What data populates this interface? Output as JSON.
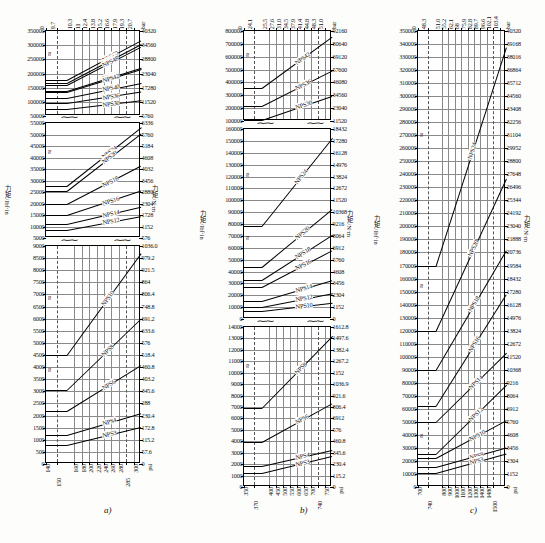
{
  "figure": {
    "axis_title_left": "力矩 /lbf·in",
    "axis_title_right": "力矩 /N·m",
    "unit_top": "bar",
    "unit_bottom": "psi",
    "panels": [
      "a)",
      "b)",
      "c)"
    ]
  },
  "chart_data": [
    {
      "id": "a-top",
      "type": "line",
      "panel": "a)",
      "title": "",
      "xlabel": "bar",
      "ylabel": "力矩 /lbf·in",
      "y2label": "力矩 /N·m",
      "ylim": [
        50000,
        350000
      ],
      "yticks": [
        50000,
        100000,
        150000,
        200000,
        250000,
        300000,
        350000
      ],
      "y2ticks": [
        5760,
        11520,
        17280,
        23040,
        28800,
        34560,
        40320
      ],
      "xticks_top": [
        "0",
        "9.7",
        "10.3",
        "11",
        "12.4",
        "13.8",
        "15.2",
        "16.6",
        "17.9",
        "19.3",
        "20.7"
      ],
      "series": [
        {
          "name": "NPS60",
          "y_start": 178000,
          "y_end": 318000
        },
        {
          "name": "NPS54",
          "y_start": 168000,
          "y_end": 305000
        },
        {
          "name": "NPS48",
          "y_start": 160000,
          "y_end": 295000
        },
        {
          "name": "NPS46",
          "y_start": 140000,
          "y_end": 222000
        },
        {
          "name": "NPS42",
          "y_start": 133000,
          "y_end": 214000
        },
        {
          "name": "NPS40",
          "y_start": 115000,
          "y_end": 168000
        },
        {
          "name": "NPS36",
          "y_start": 95000,
          "y_end": 136000
        },
        {
          "name": "NPS30",
          "y_start": 74000,
          "y_end": 105000
        }
      ]
    },
    {
      "id": "a-mid",
      "type": "line",
      "panel": "a)",
      "ylim": [
        5000,
        55000
      ],
      "yticks": [
        5000,
        10000,
        15000,
        20000,
        25000,
        30000,
        35000,
        40000,
        45000,
        50000,
        55000
      ],
      "y2ticks": [
        576,
        1152,
        1728,
        2304,
        2880,
        3456,
        4032,
        4608,
        5184,
        5760,
        6336
      ],
      "series": [
        {
          "name": "NPS24",
          "y_start": 27500,
          "y_end": 53000
        },
        {
          "name": "NPS20",
          "y_start": 25500,
          "y_end": 50500
        },
        {
          "name": "NPS18",
          "y_start": 19800,
          "y_end": 36500
        },
        {
          "name": "NPS16",
          "y_start": 14800,
          "y_end": 25500
        },
        {
          "name": "NPS14",
          "y_start": 11000,
          "y_end": 18500
        },
        {
          "name": "NPS12",
          "y_start": 8500,
          "y_end": 14500
        }
      ]
    },
    {
      "id": "a-bot",
      "type": "line",
      "panel": "a)",
      "xlabel": "psi",
      "ylim": [
        0,
        9000
      ],
      "yticks": [
        0,
        500,
        1000,
        1500,
        2000,
        2500,
        3000,
        3500,
        4000,
        4500,
        5000,
        5500,
        6000,
        6500,
        7000,
        7500,
        8000,
        8500,
        9000
      ],
      "y2ticks": [
        "0",
        "57.6",
        "115.2",
        "172.8",
        "230.4",
        "288",
        "345.6",
        "403.2",
        "460.8",
        "518.4",
        "576",
        "633.6",
        "691.2",
        "748.8",
        "806.4",
        "864",
        "921.5",
        "979.2",
        "1036.0"
      ],
      "xticks_bottom": [
        "140",
        "150",
        "160",
        "180",
        "200",
        "220",
        "240",
        "260",
        "280",
        "285",
        "300"
      ],
      "series": [
        {
          "name": "NPS10",
          "y_start": 4500,
          "y_end": 8700
        },
        {
          "name": "NPS8",
          "y_start": 3050,
          "y_end": 6000
        },
        {
          "name": "NPS6",
          "y_start": 2200,
          "y_end": 4100
        },
        {
          "name": "NPS4",
          "y_start": 1200,
          "y_end": 2100
        },
        {
          "name": "NPS3",
          "y_start": 800,
          "y_end": 1550
        }
      ]
    },
    {
      "id": "b-top",
      "type": "line",
      "panel": "b)",
      "xlabel": "bar",
      "ylim": [
        100000,
        800000
      ],
      "yticks": [
        100000,
        200000,
        300000,
        400000,
        500000,
        600000,
        700000,
        800000
      ],
      "y2ticks": [
        11520,
        23040,
        34560,
        46080,
        57600,
        69120,
        80640,
        92160
      ],
      "xticks_top": [
        "0",
        "24.1",
        "25.5",
        "27.6",
        "31.0",
        "34.5",
        "37.9",
        "41.4",
        "44.8",
        "48.3",
        "51.0"
      ],
      "series": [
        {
          "name": "NPS42",
          "y_start": 355000,
          "y_end": 755000
        },
        {
          "name": "NPS36",
          "y_start": 218000,
          "y_end": 495000
        },
        {
          "name": "NPS30",
          "y_start": 108000,
          "y_end": 295000
        }
      ]
    },
    {
      "id": "b-mid",
      "type": "line",
      "panel": "b)",
      "ylim": [
        0,
        160000
      ],
      "yticks": [
        0,
        10000,
        20000,
        30000,
        40000,
        50000,
        60000,
        70000,
        80000,
        90000,
        100000,
        110000,
        120000,
        130000,
        140000,
        150000,
        160000
      ],
      "y2ticks": [
        "0",
        "1152",
        "2304",
        "3456",
        "4608",
        "5760",
        "6912",
        "8064",
        "9216",
        "10368",
        "11520",
        "12672",
        "13824",
        "14976",
        "16128",
        "17280",
        "18432"
      ],
      "series": [
        {
          "name": "NPS24",
          "y_start": 78000,
          "y_end": 152000
        },
        {
          "name": "NPS20",
          "y_start": 44000,
          "y_end": 93000
        },
        {
          "name": "NPS18",
          "y_start": 33000,
          "y_end": 71000
        },
        {
          "name": "NPS16",
          "y_start": 27000,
          "y_end": 58000
        },
        {
          "name": "NPS14",
          "y_start": 15500,
          "y_end": 33000
        },
        {
          "name": "NPS12",
          "y_start": 10500,
          "y_end": 22000
        },
        {
          "name": "NPS10",
          "y_start": 6500,
          "y_end": 13500
        }
      ]
    },
    {
      "id": "b-bot",
      "type": "line",
      "panel": "b)",
      "xlabel": "psi",
      "ylim": [
        0,
        14000
      ],
      "yticks": [
        0,
        1000,
        2000,
        3000,
        4000,
        5000,
        6000,
        7000,
        8000,
        9000,
        10000,
        11000,
        12000,
        13000,
        14000
      ],
      "y2ticks": [
        "0",
        "115.2",
        "230.4",
        "345.6",
        "460.8",
        "576",
        "6912",
        "806.4",
        "921.6",
        "1036.9",
        "1152",
        "1267.2",
        "1382.4",
        "1497.6",
        "1612.8"
      ],
      "xticks_bottom": [
        "350",
        "370",
        "400",
        "450",
        "500",
        "550",
        "600",
        "650",
        "700",
        "740",
        "750"
      ],
      "series": [
        {
          "name": "NPS8",
          "y_start": 6900,
          "y_end": 13200
        },
        {
          "name": "NPS6",
          "y_start": 3950,
          "y_end": 7350
        },
        {
          "name": "NPS4",
          "y_start": 1850,
          "y_end": 3250
        },
        {
          "name": "NPS3",
          "y_start": 1200,
          "y_end": 2700
        }
      ]
    },
    {
      "id": "c-main",
      "type": "line",
      "panel": "c)",
      "xlabel": "psi",
      "ylim": [
        0,
        350000
      ],
      "yticks": [
        0,
        10000,
        20000,
        30000,
        40000,
        50000,
        60000,
        70000,
        80000,
        90000,
        100000,
        110000,
        120000,
        130000,
        140000,
        150000,
        160000,
        170000,
        180000,
        190000,
        200000,
        210000,
        220000,
        230000,
        240000,
        250000,
        260000,
        270000,
        280000,
        290000,
        300000,
        310000,
        320000,
        330000,
        340000,
        350000
      ],
      "y2ticks": [
        "0",
        "1152",
        "2304",
        "3456",
        "4608",
        "5760",
        "6912",
        "8064",
        "9216",
        "10368",
        "11520",
        "12672",
        "13824",
        "14976",
        "16128",
        "17280",
        "18432",
        "19584",
        "20736",
        "21888",
        "23040",
        "24192",
        "25344",
        "26496",
        "27648",
        "28800",
        "29952",
        "31104",
        "32256",
        "33408",
        "34560",
        "35712",
        "36864",
        "38016",
        "39168",
        "40320"
      ],
      "xticks_top": [
        "0",
        "48.3",
        "51.0",
        "55.2",
        "62.1",
        "68",
        "75.9",
        "82.8",
        "89.7",
        "96.6",
        "102.1",
        "103.4"
      ],
      "xticks_bottom": [
        "700",
        "740",
        "800",
        "900",
        "1000",
        "1100",
        "1200",
        "1300",
        "1400",
        "1480",
        "1500"
      ],
      "series": [
        {
          "name": "NPS24",
          "y_start": 170000,
          "y_end": 338000
        },
        {
          "name": "NPS20",
          "y_start": 120000,
          "y_end": 237000
        },
        {
          "name": "NPS18",
          "y_start": 90000,
          "y_end": 182000
        },
        {
          "name": "NPS16",
          "y_start": 62000,
          "y_end": 148000
        },
        {
          "name": "NPS14",
          "y_start": 50000,
          "y_end": 103000
        },
        {
          "name": "NPS12",
          "y_start": 25000,
          "y_end": 78000
        },
        {
          "name": "NPS10",
          "y_start": 22000,
          "y_end": 51000
        },
        {
          "name": "NPS8",
          "y_start": 15000,
          "y_end": 30000
        },
        {
          "name": "NPS3",
          "y_start": 11000,
          "y_end": 26000
        }
      ]
    }
  ]
}
